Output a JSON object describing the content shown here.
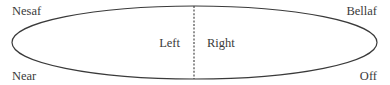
{
  "diagram": {
    "corner_labels": {
      "top_left": "Nesaf",
      "bottom_left": "Near",
      "top_right": "Bellaf",
      "bottom_right": "Off"
    },
    "halves": {
      "left": "Left",
      "right": "Right"
    },
    "colors": {
      "stroke": "#3a3a3a",
      "text": "#3a3a3a",
      "background": "#ffffff"
    }
  }
}
